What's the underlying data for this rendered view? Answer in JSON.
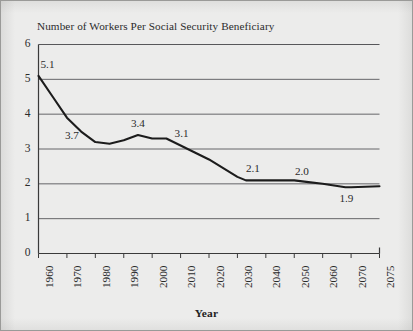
{
  "figure": {
    "background_color": "#ececeb",
    "border_color": "#9a9a98",
    "axis_color": "#3a3a3a",
    "line_color": "#1c1c1c",
    "text_color": "#2b2b2b"
  },
  "chart_data": {
    "type": "line",
    "title": "Number of Workers Per Social Security Beneficiary",
    "xlabel": "Year",
    "ylabel": "",
    "xlim": [
      1960,
      2075
    ],
    "ylim": [
      0,
      6
    ],
    "grid": true,
    "legend": false,
    "y_ticks": [
      "0",
      "1",
      "2",
      "3",
      "4",
      "5",
      "6"
    ],
    "y_tick_values": [
      0,
      1,
      2,
      3,
      4,
      5,
      6
    ],
    "x_ticks": [
      "1960",
      "1970",
      "1980",
      "1990",
      "2000",
      "2010",
      "2020",
      "2030",
      "2040",
      "2050",
      "2060",
      "2070",
      "2075"
    ],
    "x_tick_values": [
      1960,
      1970,
      1980,
      1990,
      2000,
      2010,
      2020,
      2030,
      2040,
      2050,
      2060,
      2070,
      2075
    ],
    "series": [
      {
        "name": "Workers per beneficiary",
        "x": [
          1960,
          1965,
          1970,
          1975,
          1980,
          1985,
          1990,
          1995,
          2000,
          2005,
          2010,
          2015,
          2020,
          2025,
          2030,
          2033,
          2040,
          2050,
          2055,
          2060,
          2068,
          2070,
          2075
        ],
        "values": [
          5.1,
          4.5,
          3.9,
          3.5,
          3.2,
          3.15,
          3.25,
          3.4,
          3.3,
          3.3,
          3.1,
          2.9,
          2.7,
          2.45,
          2.2,
          2.1,
          2.1,
          2.1,
          2.05,
          2.0,
          1.9,
          1.9,
          1.93
        ]
      }
    ],
    "annotations": [
      {
        "label": "5.1",
        "x": 1960,
        "y": 5.1
      },
      {
        "label": "3.7",
        "x": 1970,
        "y": 3.7
      },
      {
        "label": "3.4",
        "x": 1995,
        "y": 3.4
      },
      {
        "label": "3.1",
        "x": 2010,
        "y": 3.1
      },
      {
        "label": "2.1",
        "x": 2033,
        "y": 2.1
      },
      {
        "label": "2.0",
        "x": 2052,
        "y": 2.0
      },
      {
        "label": "1.9",
        "x": 2068,
        "y": 1.9
      }
    ]
  }
}
